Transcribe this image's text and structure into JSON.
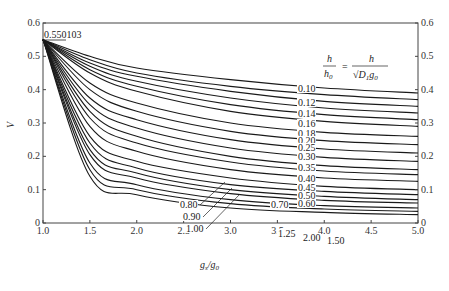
{
  "chart_data": {
    "type": "line",
    "title": "",
    "xlabel": "g_s/g_0",
    "ylabel": "V",
    "xlim": [
      1.0,
      5.0
    ],
    "ylim": [
      0,
      0.6
    ],
    "x_ticks": [
      "1.0",
      "1.5",
      "2.0",
      "2.5",
      "3.0",
      "3.5",
      "4.0",
      "4.5",
      "5.0"
    ],
    "y_ticks_left": [
      "0",
      "0.1",
      "0.2",
      "0.3",
      "0.4",
      "0.5",
      "0.6"
    ],
    "y_ticks_right": [
      "0",
      "0.1",
      "0.2",
      "0.3",
      "0.4",
      "0.5",
      "0.6"
    ],
    "grid": false,
    "annotation_origin": "0.550103",
    "legend_formula": {
      "lhs_num": "h",
      "lhs_den": "h0",
      "rhs_num": "h",
      "rhs_den": "√(D1 g0)"
    },
    "origin_point": {
      "x": 1.0,
      "y": 0.55
    },
    "series": [
      {
        "name": "0.10",
        "x": [
          1.0,
          1.5,
          2.0,
          3.0,
          4.0,
          5.0
        ],
        "values": [
          0.55,
          0.5,
          0.465,
          0.43,
          0.405,
          0.39
        ]
      },
      {
        "name": "0.12",
        "x": [
          1.0,
          1.5,
          2.0,
          3.0,
          4.0,
          5.0
        ],
        "values": [
          0.55,
          0.49,
          0.45,
          0.41,
          0.385,
          0.37
        ]
      },
      {
        "name": "0.14",
        "x": [
          1.0,
          1.5,
          2.0,
          3.0,
          4.0,
          5.0
        ],
        "values": [
          0.55,
          0.48,
          0.44,
          0.395,
          0.365,
          0.35
        ]
      },
      {
        "name": "0.16",
        "x": [
          1.0,
          1.5,
          2.0,
          3.0,
          4.0,
          5.0
        ],
        "values": [
          0.55,
          0.47,
          0.425,
          0.375,
          0.345,
          0.33
        ]
      },
      {
        "name": "0.18",
        "x": [
          1.0,
          1.5,
          2.0,
          3.0,
          4.0,
          5.0
        ],
        "values": [
          0.55,
          0.46,
          0.41,
          0.355,
          0.325,
          0.31
        ]
      },
      {
        "name": "0.20",
        "x": [
          1.0,
          1.5,
          2.0,
          3.0,
          4.0,
          5.0
        ],
        "values": [
          0.55,
          0.45,
          0.395,
          0.335,
          0.305,
          0.29
        ]
      },
      {
        "name": "0.25",
        "x": [
          1.0,
          1.5,
          2.0,
          3.0,
          4.0,
          5.0
        ],
        "values": [
          0.55,
          0.42,
          0.36,
          0.3,
          0.272,
          0.26
        ]
      },
      {
        "name": "0.30",
        "x": [
          1.0,
          1.5,
          2.0,
          3.0,
          4.0,
          5.0
        ],
        "values": [
          0.55,
          0.4,
          0.335,
          0.275,
          0.247,
          0.235
        ]
      },
      {
        "name": "0.35",
        "x": [
          1.0,
          1.5,
          2.0,
          3.0,
          4.0,
          5.0
        ],
        "values": [
          0.55,
          0.375,
          0.31,
          0.25,
          0.222,
          0.21
        ]
      },
      {
        "name": "0.40",
        "x": [
          1.0,
          1.5,
          2.0,
          3.0,
          4.0,
          5.0
        ],
        "values": [
          0.55,
          0.355,
          0.285,
          0.225,
          0.197,
          0.185
        ]
      },
      {
        "name": "0.45",
        "x": [
          1.0,
          1.5,
          2.0,
          3.0,
          4.0,
          5.0
        ],
        "values": [
          0.55,
          0.335,
          0.26,
          0.2,
          0.172,
          0.16
        ]
      },
      {
        "name": "0.50",
        "x": [
          1.0,
          1.5,
          2.0,
          3.0,
          4.0,
          5.0
        ],
        "values": [
          0.55,
          0.315,
          0.24,
          0.183,
          0.156,
          0.145
        ]
      },
      {
        "name": "0.60",
        "x": [
          1.0,
          1.5,
          2.0,
          3.0,
          4.0,
          5.0
        ],
        "values": [
          0.55,
          0.29,
          0.215,
          0.16,
          0.135,
          0.125
        ]
      },
      {
        "name": "0.70",
        "x": [
          1.0,
          1.5,
          2.0,
          3.0,
          4.0,
          5.0
        ],
        "values": [
          0.55,
          0.26,
          0.185,
          0.135,
          0.11,
          0.1
        ]
      },
      {
        "name": "0.80",
        "x": [
          1.0,
          1.5,
          2.0,
          3.0,
          4.0,
          5.0
        ],
        "values": [
          0.55,
          0.24,
          0.165,
          0.115,
          0.095,
          0.085
        ]
      },
      {
        "name": "0.90",
        "x": [
          1.0,
          1.5,
          2.0,
          3.0,
          4.0,
          5.0
        ],
        "values": [
          0.55,
          0.22,
          0.15,
          0.1,
          0.08,
          0.07
        ]
      },
      {
        "name": "1.00",
        "x": [
          1.0,
          1.5,
          2.0,
          3.0,
          4.0,
          5.0
        ],
        "values": [
          0.55,
          0.205,
          0.135,
          0.088,
          0.068,
          0.06
        ]
      },
      {
        "name": "1.25",
        "x": [
          1.0,
          1.5,
          2.0,
          3.0,
          4.0,
          5.0
        ],
        "values": [
          0.55,
          0.18,
          0.115,
          0.07,
          0.052,
          0.045
        ]
      },
      {
        "name": "1.50",
        "x": [
          1.0,
          1.5,
          2.0,
          3.0,
          4.0,
          5.0
        ],
        "values": [
          0.55,
          0.16,
          0.1,
          0.058,
          0.042,
          0.035
        ]
      },
      {
        "name": "2.00",
        "x": [
          1.0,
          1.5,
          2.0,
          3.0,
          4.0,
          5.0
        ],
        "values": [
          0.55,
          0.14,
          0.085,
          0.045,
          0.032,
          0.025
        ]
      }
    ],
    "curve_labels": [
      {
        "text": "0.10",
        "x": 298,
        "y": 92
      },
      {
        "text": "0.12",
        "x": 298,
        "y": 106
      },
      {
        "text": "0.14",
        "x": 298,
        "y": 117
      },
      {
        "text": "0.16",
        "x": 298,
        "y": 127
      },
      {
        "text": "0.18",
        "x": 298,
        "y": 137
      },
      {
        "text": "0.20",
        "x": 298,
        "y": 144
      },
      {
        "text": "0.25",
        "x": 298,
        "y": 151
      },
      {
        "text": "0.30",
        "x": 298,
        "y": 160
      },
      {
        "text": "0.35",
        "x": 298,
        "y": 171
      },
      {
        "text": "0.40",
        "x": 298,
        "y": 182
      },
      {
        "text": "0.45",
        "x": 298,
        "y": 191
      },
      {
        "text": "0.50",
        "x": 298,
        "y": 199
      },
      {
        "text": "0.60",
        "x": 298,
        "y": 207
      },
      {
        "text": "0.70",
        "x": 271,
        "y": 208
      },
      {
        "text": "0.80",
        "x": 180,
        "y": 208
      },
      {
        "text": "0.90",
        "x": 183,
        "y": 220
      },
      {
        "text": "1.00",
        "x": 186,
        "y": 232
      },
      {
        "text": "1.25",
        "x": 278,
        "y": 237
      },
      {
        "text": "2.00",
        "x": 303,
        "y": 241
      },
      {
        "text": "1.50",
        "x": 327,
        "y": 244
      }
    ]
  }
}
